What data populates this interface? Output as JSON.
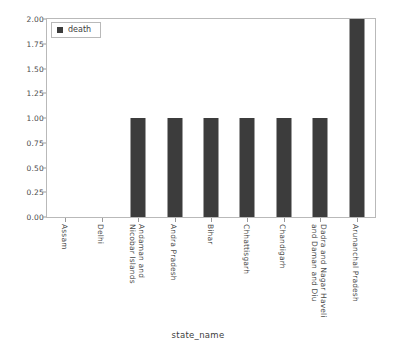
{
  "chart_data": {
    "type": "bar",
    "title": "",
    "xlabel": "state_name",
    "ylabel": "",
    "categories": [
      "Assam",
      "Delhi",
      "Andaman and\nNicobar Islands",
      "Andra Pradesh",
      "Bihar",
      "Chhattisgarh",
      "Chandigarh",
      "Dadra and Nagar Haveli\nand Daman and Diu",
      "Arunanchal Pradesh"
    ],
    "series": [
      {
        "name": "death",
        "values": [
          0,
          0,
          1,
          1,
          1,
          1,
          1,
          1,
          2
        ],
        "color": "#3c3c3c"
      }
    ],
    "ylim": [
      0,
      2
    ],
    "ytick_labels": [
      "0.00",
      "0.25",
      "0.50",
      "0.75",
      "1.00",
      "1.25",
      "1.50",
      "1.75",
      "2.00"
    ],
    "ytick_values": [
      0,
      0.25,
      0.5,
      0.75,
      1.0,
      1.25,
      1.5,
      1.75,
      2.0
    ],
    "grid": false,
    "legend": {
      "position": "upper-left",
      "entries": [
        {
          "label": "death",
          "color": "#3c3c3c",
          "marker": "square"
        }
      ]
    }
  },
  "figure": {
    "background_color": "#ffffff",
    "axis_color": "#b9b9b9",
    "text_color": "#4a4a4a"
  }
}
